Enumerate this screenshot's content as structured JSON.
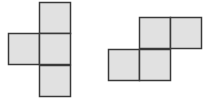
{
  "diagram": {
    "cell_size": 31,
    "fill_color": "#e1e1e1",
    "stroke_color": "#3a3a3a",
    "stroke_width": 1.5,
    "shapes": [
      {
        "name": "left-figure",
        "type": "tetromino-T",
        "cells": [
          {
            "x": 39,
            "y": 2
          },
          {
            "x": 8,
            "y": 33
          },
          {
            "x": 39,
            "y": 33
          },
          {
            "x": 39,
            "y": 65
          }
        ]
      },
      {
        "name": "right-figure",
        "type": "tetromino-S",
        "cells": [
          {
            "x": 139,
            "y": 17
          },
          {
            "x": 170,
            "y": 17
          },
          {
            "x": 108,
            "y": 49
          },
          {
            "x": 139,
            "y": 49
          }
        ]
      }
    ]
  }
}
